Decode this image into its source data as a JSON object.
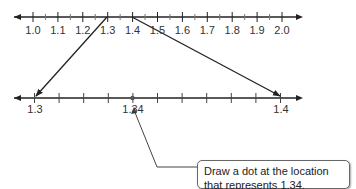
{
  "top_line": {
    "min": 1.0,
    "max": 2.0,
    "labels": [
      "1.0",
      "1.1",
      "1.2",
      "1.3",
      "1.4",
      "1.5",
      "1.6",
      "1.7",
      "1.8",
      "1.9",
      "2.0"
    ],
    "zoom_segment": [
      "1.3",
      "1.4"
    ]
  },
  "bottom_line": {
    "min": 1.3,
    "max": 1.4,
    "labels": {
      "left": "1.3",
      "point": "1.34",
      "right": "1.4"
    },
    "point_value": 1.34
  },
  "callout": {
    "line1": "Draw a dot at the location",
    "line2": "that represents 1.34."
  },
  "colors": {
    "line": "#222222",
    "tick": "#555555",
    "connector": "#222222"
  }
}
